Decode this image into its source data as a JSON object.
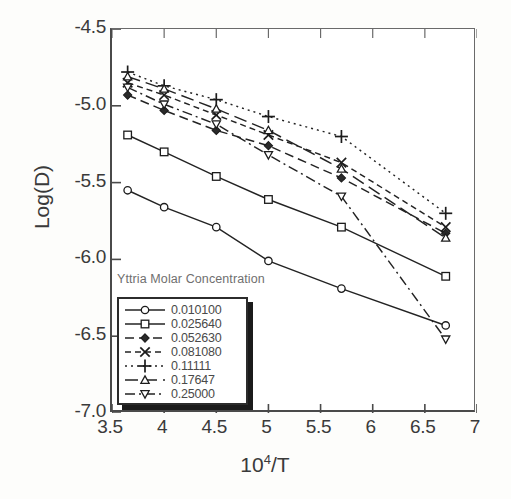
{
  "axes": {
    "ylabel": "Log(D)",
    "xlabel_base": "10",
    "xlabel_exp": "4",
    "xlabel_tail": "/T",
    "yticks": [
      "-4.5",
      "-5.0",
      "-5.5",
      "-6.0",
      "-6.5",
      "-7.0"
    ],
    "xticks": [
      "3.5",
      "4",
      "4.5",
      "5",
      "5.5",
      "6",
      "6.5",
      "7"
    ]
  },
  "legend": {
    "title": "Yttria Molar Concentration",
    "entries": [
      {
        "label": "0.010100",
        "marker": "circle",
        "dash": "solid"
      },
      {
        "label": "0.025640",
        "marker": "square",
        "dash": "solid"
      },
      {
        "label": "0.052630",
        "marker": "diamond",
        "dash": "dash"
      },
      {
        "label": "0.081080",
        "marker": "cross-x",
        "dash": "dash-short"
      },
      {
        "label": "0.11111",
        "marker": "plus",
        "dash": "dot"
      },
      {
        "label": "0.17647",
        "marker": "triangle-up",
        "dash": "long-dash"
      },
      {
        "label": "0.25000",
        "marker": "triangle-down",
        "dash": "dash-dot"
      }
    ]
  },
  "chart_data": {
    "type": "line",
    "title": "",
    "xlabel": "10^4/T",
    "ylabel": "Log(D)",
    "xlim": [
      3.5,
      7.0
    ],
    "ylim": [
      -7.0,
      -4.5
    ],
    "grid": false,
    "legend_position": "lower-left-inside",
    "legend_title": "Yttria Molar Concentration",
    "x": [
      3.65,
      4.0,
      4.5,
      5.0,
      5.7,
      6.7
    ],
    "series": [
      {
        "name": "0.010100",
        "marker": "circle",
        "dash": "solid",
        "values": [
          -5.55,
          -5.66,
          -5.79,
          -6.01,
          -6.19,
          -6.43
        ]
      },
      {
        "name": "0.025640",
        "marker": "square",
        "dash": "solid",
        "values": [
          -5.19,
          -5.3,
          -5.46,
          -5.61,
          -5.79,
          -6.11
        ]
      },
      {
        "name": "0.052630",
        "marker": "diamond",
        "dash": "dash",
        "values": [
          -4.93,
          -5.03,
          -5.16,
          -5.26,
          -5.47,
          -5.83
        ]
      },
      {
        "name": "0.081080",
        "marker": "cross-x",
        "dash": "dash-short",
        "values": [
          -4.85,
          -4.93,
          -5.06,
          -5.19,
          -5.37,
          -5.79
        ]
      },
      {
        "name": "0.11111",
        "marker": "plus",
        "dash": "dot",
        "values": [
          -4.78,
          -4.87,
          -4.96,
          -5.07,
          -5.2,
          -5.7
        ]
      },
      {
        "name": "0.17647",
        "marker": "triangle-up",
        "dash": "long-dash",
        "values": [
          -4.81,
          -4.89,
          -5.02,
          -5.16,
          -5.41,
          -5.86
        ]
      },
      {
        "name": "0.25000",
        "marker": "triangle-down",
        "dash": "dash-dot",
        "values": [
          -4.88,
          -4.99,
          -5.12,
          -5.32,
          -5.59,
          -6.52
        ]
      }
    ]
  }
}
